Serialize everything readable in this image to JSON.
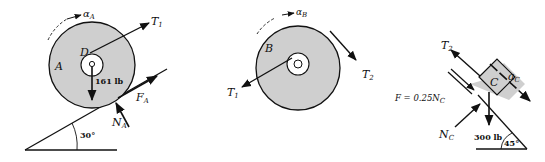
{
  "colors": {
    "fill": "#cfcfcf",
    "stroke": "#111111",
    "background": "#ffffff"
  },
  "figure_A": {
    "body_label": "A",
    "point_label": "D",
    "alpha_label": "α",
    "alpha_sub": "A",
    "tension_label": "T",
    "tension_sub": "1",
    "weight_label": "161 lb",
    "friction_label": "F",
    "friction_sub": "A",
    "normal_label": "N",
    "normal_sub": "A",
    "angle_label": "30°"
  },
  "figure_B": {
    "body_label": "B",
    "alpha_label": "α",
    "alpha_sub": "B",
    "tension1_label": "T",
    "tension1_sub": "1",
    "tension2_label": "T",
    "tension2_sub": "2"
  },
  "figure_C": {
    "body_label": "C",
    "tension_label": "T",
    "tension_sub": "2",
    "accel_label": "a",
    "accel_sub": "C",
    "friction_eq": "F = 0.25N",
    "friction_eq_sub": "C",
    "normal_label": "N",
    "normal_sub": "C",
    "weight_label": "300 lb",
    "angle_label": "45°"
  }
}
